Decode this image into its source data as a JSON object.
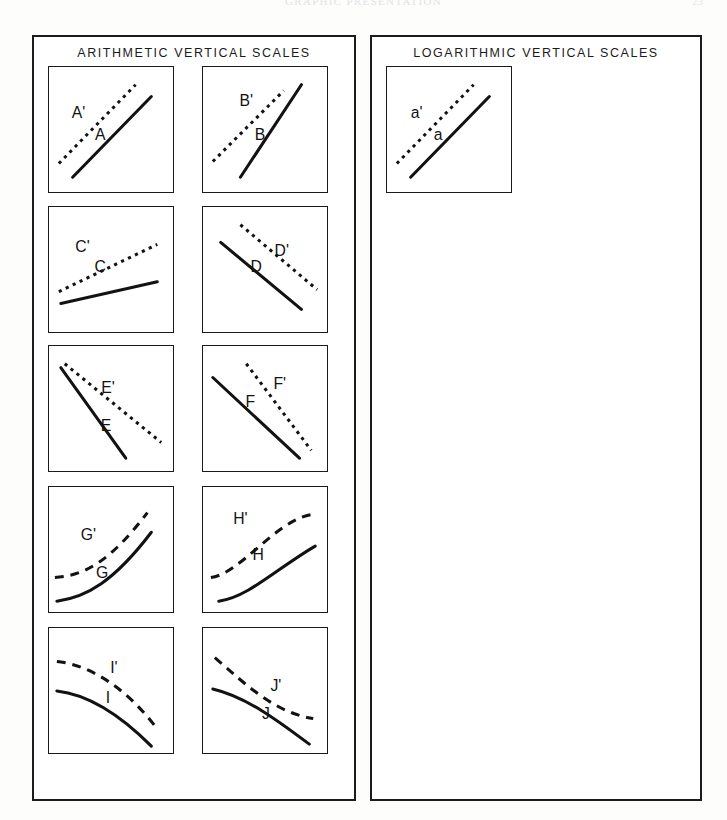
{
  "page": {
    "running_head": "GRAPHIC PRESENTATION",
    "folio": "23"
  },
  "sections": [
    {
      "id": "arithmetic",
      "title": "ARITHMETIC VERTICAL SCALES",
      "cells": [
        {
          "id": "A",
          "solid_label": "A",
          "dashed_label": "A'",
          "shape": "rising-straight-parallel",
          "dash_style": "fine"
        },
        {
          "id": "B",
          "solid_label": "B",
          "dashed_label": "B'",
          "shape": "rising-straight-steep-converging",
          "dash_style": "fine"
        },
        {
          "id": "C",
          "solid_label": "C",
          "dashed_label": "C'",
          "shape": "rising-shallow-diverging",
          "dash_style": "fine"
        },
        {
          "id": "D",
          "solid_label": "D",
          "dashed_label": "D'",
          "shape": "falling-straight-parallel",
          "dash_style": "fine"
        },
        {
          "id": "E",
          "solid_label": "E",
          "dashed_label": "E'",
          "shape": "falling-straight-diverging",
          "dash_style": "fine"
        },
        {
          "id": "F",
          "solid_label": "F",
          "dashed_label": "F'",
          "shape": "falling-straight-parallel-offset",
          "dash_style": "fine"
        },
        {
          "id": "G",
          "solid_label": "G",
          "dashed_label": "G'",
          "shape": "convex-rising-accelerating",
          "dash_style": "coarse"
        },
        {
          "id": "H",
          "solid_label": "H",
          "dashed_label": "H'",
          "shape": "concave-rising-saturating",
          "dash_style": "coarse"
        },
        {
          "id": "I",
          "solid_label": "I",
          "dashed_label": "I'",
          "shape": "falling-decelerating",
          "dash_style": "coarse"
        },
        {
          "id": "J",
          "solid_label": "J",
          "dashed_label": "J'",
          "shape": "falling-crossing",
          "dash_style": "coarse"
        }
      ]
    },
    {
      "id": "logarithmic",
      "title": "LOGARITHMIC VERTICAL SCALES",
      "cells": [
        {
          "id": "a",
          "solid_label": "a",
          "dashed_label": "a'",
          "shape": "rising-straight-parallel",
          "dash_style": "fine"
        },
        {
          "id": "b",
          "solid_label": "b",
          "dashed_label": "b'",
          "shape": "rising-shallow-converging",
          "dash_style": "fine"
        },
        {
          "id": "c",
          "solid_label": "c",
          "dashed_label": "c'",
          "shape": "rising-shallow-diverging",
          "dash_style": "fine"
        },
        {
          "id": "d",
          "solid_label": "d",
          "dashed_label": "d'",
          "shape": "falling-straight-parallel",
          "dash_style": "fine"
        },
        {
          "id": "e",
          "solid_label": "e",
          "dashed_label": "e'",
          "shape": "falling-straight-diverging",
          "dash_style": "fine"
        },
        {
          "id": "f",
          "solid_label": "f",
          "dashed_label": "f'",
          "shape": "falling-straight-parallel-offset",
          "dash_style": "fine"
        },
        {
          "id": "g",
          "solid_label": "g",
          "dashed_label": "g'",
          "shape": "convex-rising-accelerating",
          "dash_style": "coarse"
        },
        {
          "id": "h",
          "solid_label": "h",
          "dashed_label": "h'",
          "shape": "concave-rising-saturating",
          "dash_style": "coarse"
        },
        {
          "id": "i",
          "solid_label": "i",
          "dashed_label": "i'",
          "shape": "falling-decelerating",
          "dash_style": "coarse"
        },
        {
          "id": "j",
          "solid_label": "j",
          "dashed_label": "j'",
          "shape": "falling-crossing",
          "dash_style": "coarse"
        }
      ]
    }
  ],
  "geometry": {
    "cell_w": 126,
    "cell_h": 127,
    "col_x": [
      14,
      168
    ],
    "row_y": [
      29,
      169,
      308,
      449,
      590
    ],
    "shapes": {
      "rising-straight-parallel": {
        "solid": "M 24 112 L 104 30",
        "dashed": "M 10 98 L 88 18",
        "solid_label_xy": [
          52,
          74
        ],
        "dashed_label_xy": [
          30,
          52
        ]
      },
      "rising-straight-steep-converging": {
        "solid": "M 38 112 L 100 18",
        "dashed": "M 10 96 L 82 24",
        "solid_label_xy": [
          58,
          74
        ],
        "dashed_label_xy": [
          44,
          40
        ]
      },
      "rising-shallow-diverging": {
        "solid": "M 12 98 L 110 76",
        "dashed": "M 10 86 L 110 38",
        "solid_label_xy": [
          52,
          66
        ],
        "dashed_label_xy": [
          34,
          46
        ]
      },
      "falling-straight-parallel": {
        "solid": "M 18 36 L 100 104",
        "dashed": "M 38 18 L 116 84",
        "solid_label_xy": [
          54,
          66
        ],
        "dashed_label_xy": [
          80,
          50
        ]
      },
      "falling-straight-diverging": {
        "solid": "M 12 22 L 78 114",
        "dashed": "M 16 18 L 114 98",
        "solid_label_xy": [
          58,
          86
        ],
        "dashed_label_xy": [
          60,
          48
        ]
      },
      "falling-straight-parallel-offset": {
        "solid": "M 10 32 L 98 114",
        "dashed": "M 44 18 L 110 106",
        "solid_label_xy": [
          48,
          62
        ],
        "dashed_label_xy": [
          78,
          44
        ]
      },
      "convex-rising-accelerating": {
        "solid": "M 8 116 C 38 112 66 96 104 46",
        "dashed": "M 6 92 C 36 90 62 76 100 26",
        "solid_label_xy": [
          54,
          92
        ],
        "dashed_label_xy": [
          40,
          54
        ]
      },
      "concave-rising-saturating": {
        "solid": "M 16 116 C 46 112 76 82 114 60",
        "dashed": "M 8 92 C 38 88 74 34 110 28",
        "solid_label_xy": [
          56,
          74
        ],
        "dashed_label_xy": [
          38,
          38
        ]
      },
      "falling-decelerating": {
        "solid": "M 8 64 C 44 68 76 92 104 120",
        "dashed": "M 8 34 C 46 38 82 66 108 100",
        "solid_label_xy": [
          60,
          76
        ],
        "dashed_label_xy": [
          66,
          46
        ]
      },
      "falling-crossing": {
        "solid": "M 10 62 C 44 70 76 94 108 118",
        "dashed": "M 12 30 C 46 60 74 86 112 92",
        "solid_label_xy": [
          64,
          92
        ],
        "dashed_label_xy": [
          74,
          64
        ]
      }
    }
  }
}
